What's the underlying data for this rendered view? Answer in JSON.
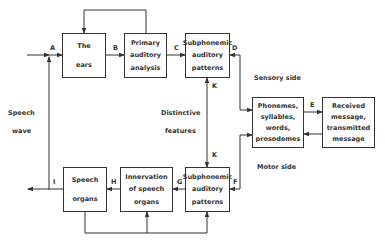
{
  "diagram": {
    "boxes": {
      "ears": {
        "lines": [
          "The",
          "ears"
        ]
      },
      "primary": {
        "lines": [
          "Primary",
          "auditory",
          "analysis"
        ]
      },
      "sub_top": {
        "lines": [
          "Subphonemic",
          "auditory",
          "patterns"
        ]
      },
      "phonemes": {
        "lines": [
          "Phonemes,",
          "syllables,",
          "words,",
          "prosodemes"
        ]
      },
      "received": {
        "lines": [
          "Received",
          "message,",
          "transmitted",
          "message"
        ]
      },
      "speech_organs": {
        "lines": [
          "Speech",
          "organs"
        ]
      },
      "innervation": {
        "lines": [
          "Innervation",
          "of speech",
          "organs"
        ]
      },
      "sub_bottom": {
        "lines": [
          "Subphonemic",
          "auditory",
          "patterns"
        ]
      }
    },
    "edge_labels": {
      "A": "A",
      "B": "B",
      "C": "C",
      "D": "D",
      "E": "E",
      "F": "F",
      "G": "G",
      "H": "H",
      "I": "I",
      "K_top": "K",
      "K_bottom": "K"
    },
    "annotations": {
      "speech": "Speech",
      "wave": "wave",
      "distinctive": "Distinctive",
      "features": "features",
      "sensory_side": "Sensory side",
      "motor_side": "Motor side"
    },
    "colors": {
      "line": "#333333",
      "background": "#ffffff"
    }
  }
}
